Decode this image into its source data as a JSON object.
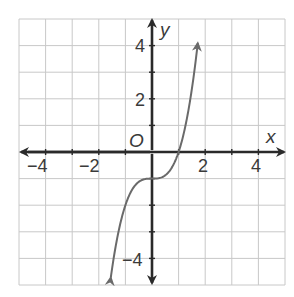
{
  "chart_data": {
    "type": "line",
    "title": "",
    "xlabel": "x",
    "ylabel": "y",
    "origin_label": "O",
    "xlim": [
      -5,
      5
    ],
    "ylim": [
      -5,
      5
    ],
    "grid": true,
    "grid_step": 1,
    "x_ticks": [
      -4,
      -2,
      2,
      4
    ],
    "y_ticks": [
      4,
      2,
      -4
    ],
    "series": [
      {
        "name": "f(x) = x^3 - 1",
        "function": "x^3 - 1",
        "x_range": [
          -1.55,
          1.72
        ],
        "points": [
          {
            "x": -1.5,
            "y": -4.375
          },
          {
            "x": -1,
            "y": -2
          },
          {
            "x": -0.5,
            "y": -1.125
          },
          {
            "x": 0,
            "y": -1
          },
          {
            "x": 0.5,
            "y": -0.875
          },
          {
            "x": 1,
            "y": 0
          },
          {
            "x": 1.5,
            "y": 2.375
          },
          {
            "x": 1.7,
            "y": 3.913
          }
        ],
        "color": "#6a6a6a",
        "arrows_at_ends": true
      }
    ]
  },
  "labels": {
    "x_axis": "x",
    "y_axis": "y",
    "origin": "O",
    "tick_neg4": "−4",
    "tick_neg2": "−2",
    "tick_2": "2",
    "tick_4": "4",
    "ytick_4": "4",
    "ytick_2": "2",
    "ytick_neg4": "−4"
  }
}
